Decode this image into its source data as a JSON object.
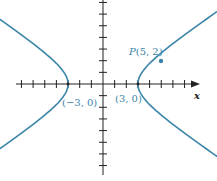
{
  "diagram": {
    "colors": {
      "curve": "#3a84a8",
      "axis": "#222222",
      "label": "#3a84a8"
    },
    "axis_label_x": "x",
    "vertex_left_label": "(−3, 0)",
    "vertex_right_label": "(3, 0)",
    "point_label": "P(5, 2)",
    "point_label_italic": "P",
    "point_label_rest": "(5, 2)"
  }
}
